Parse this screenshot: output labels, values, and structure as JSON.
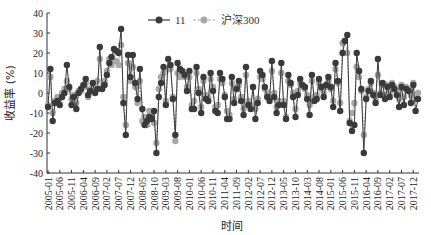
{
  "chart_data": {
    "type": "line",
    "title": "",
    "xlabel": "时间",
    "ylabel": "收益率 (%)",
    "ylim": [
      -40,
      40
    ],
    "yticks": [
      40,
      30,
      20,
      10,
      0,
      -10,
      -20,
      -30,
      -40
    ],
    "grid": false,
    "legend_position": "top-center",
    "x_start": "2005-01",
    "x_end": "2017-12",
    "frequency": "monthly",
    "xtick_labels": [
      "2005-01",
      "2005-06",
      "2005-11",
      "2006-04",
      "2006-09",
      "2007-02",
      "2007-07",
      "2007-12",
      "2008-05",
      "2008-10",
      "2009-03",
      "2009-08",
      "2010-01",
      "2010-06",
      "2010-11",
      "2011-04",
      "2011-09",
      "2012-02",
      "2012-07",
      "2012-12",
      "2013-05",
      "2013-10",
      "2014-03",
      "2014-08",
      "2015-01",
      "2015-06",
      "2015-11",
      "2016-04",
      "2016-09",
      "2017-02",
      "2017-07",
      "2017-12"
    ],
    "series": [
      {
        "name": "11",
        "color": "#3a3a3a",
        "line_style": "solid",
        "values": [
          -7,
          12,
          -14,
          -5,
          -4,
          -6,
          -2,
          0,
          14,
          3,
          -6,
          -2,
          -8,
          0,
          2,
          4,
          7,
          -1,
          1,
          5,
          0,
          2,
          23,
          2,
          4,
          9,
          15,
          18,
          22,
          21,
          20,
          32,
          -5,
          -21,
          19,
          8,
          19,
          5,
          -3,
          12,
          -8,
          -16,
          -14,
          -12,
          -13,
          -9,
          -30,
          -2,
          5,
          13,
          -6,
          17,
          14,
          -3,
          -21,
          15,
          12,
          11,
          9,
          1,
          11,
          -8,
          -8,
          13,
          0,
          -10,
          8,
          -3,
          -4,
          10,
          1,
          -9,
          -10,
          10,
          7,
          -2,
          -13,
          -13,
          8,
          -5,
          2,
          6,
          -4,
          -11,
          13,
          -6,
          -8,
          3,
          -13,
          -5,
          11,
          9,
          3,
          -2,
          -4,
          16,
          -2,
          -10,
          -6,
          15,
          -6,
          -13,
          9,
          5,
          -2,
          -12,
          -1,
          7,
          4,
          3,
          -3,
          -11,
          9,
          -4,
          -3,
          7,
          3,
          -2,
          4,
          8,
          3,
          -7,
          15,
          6,
          -9,
          20,
          26,
          29,
          -15,
          -19,
          -16,
          20,
          11,
          2,
          -30,
          -3,
          1,
          6,
          -1,
          -5,
          17,
          -1,
          5,
          -3,
          3,
          -2,
          4,
          2,
          -1,
          -7,
          3,
          -6,
          2,
          1,
          -5,
          4,
          -9,
          -3
        ]
      },
      {
        "name": "沪深300",
        "color": "#a8a8a8",
        "line_style": "dashed",
        "values": [
          -6,
          8,
          -10,
          -4,
          -2,
          -2,
          0,
          2,
          6,
          2,
          -3,
          -1,
          -5,
          1,
          1,
          3,
          5,
          -2,
          2,
          4,
          2,
          6,
          17,
          3,
          6,
          11,
          17,
          14,
          16,
          16,
          14,
          24,
          -2,
          -16,
          15,
          6,
          13,
          3,
          -5,
          6,
          -14,
          -12,
          -16,
          -9,
          -11,
          -15,
          -25,
          2,
          8,
          10,
          -4,
          12,
          12,
          -2,
          -24,
          10,
          8,
          10,
          8,
          3,
          8,
          -6,
          -4,
          10,
          2,
          -7,
          6,
          -1,
          -2,
          7,
          3,
          -7,
          -6,
          7,
          5,
          -1,
          -9,
          -11,
          5,
          -3,
          3,
          4,
          -2,
          -8,
          9,
          -4,
          -6,
          3,
          -8,
          -3,
          8,
          7,
          2,
          0,
          -2,
          11,
          0,
          -7,
          -4,
          10,
          -4,
          -12,
          6,
          4,
          0,
          -8,
          1,
          5,
          3,
          2,
          -1,
          -6,
          6,
          -2,
          -1,
          5,
          2,
          0,
          3,
          6,
          2,
          -4,
          12,
          5,
          -5,
          25,
          26,
          20,
          -14,
          -10,
          -5,
          13,
          8,
          1,
          -21,
          -2,
          2,
          5,
          0,
          -3,
          9,
          0,
          4,
          -1,
          4,
          0,
          5,
          3,
          1,
          -3,
          4,
          -2,
          3,
          2,
          -1,
          5,
          -3,
          0
        ]
      }
    ]
  },
  "legend": {
    "items": [
      {
        "label": "11"
      },
      {
        "label": "沪深300"
      }
    ]
  },
  "axes": {
    "y_title": "收益率 (%)",
    "x_title": "时间"
  }
}
